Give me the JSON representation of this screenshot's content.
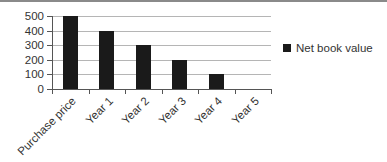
{
  "chart_data": {
    "type": "bar",
    "title": "",
    "xlabel": "",
    "ylabel": "",
    "categories": [
      "Purchase price",
      "Year 1",
      "Year 2",
      "Year 3",
      "Year 4",
      "Year 5"
    ],
    "series": [
      {
        "name": "Net book value",
        "color": "#1a1a1a",
        "values": [
          500,
          400,
          300,
          200,
          100,
          0
        ]
      }
    ],
    "ylim": [
      0,
      500
    ],
    "yticks": [
      0,
      100,
      200,
      300,
      400,
      500
    ],
    "grid": true,
    "legend_position": "right"
  },
  "legend": {
    "label": "Net book value"
  }
}
